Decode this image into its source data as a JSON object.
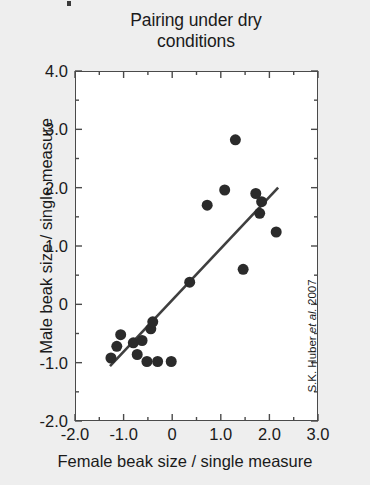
{
  "chart_data": {
    "type": "scatter",
    "title": "Pairing under dry conditions",
    "title_lines": [
      "Pairing under dry",
      "conditions"
    ],
    "xlabel": "Female beak size / single measure",
    "ylabel": "Male beak size / single measure",
    "attribution_prefix": "S.K. Huber ",
    "attribution_italic": "et al.",
    "attribution_suffix": " 2007",
    "xlim": [
      -2.0,
      3.0
    ],
    "ylim": [
      -2.0,
      4.0
    ],
    "xticks": [
      -2.0,
      -1.0,
      0,
      1.0,
      2.0,
      3.0
    ],
    "xtick_labels": [
      "-2.0",
      "-1.0",
      "0",
      "1.0",
      "2.0",
      "3.0"
    ],
    "yticks": [
      4.0,
      3.0,
      2.0,
      1.0,
      0,
      -1.0,
      -2.0
    ],
    "ytick_labels": [
      "4.0",
      "3.0",
      "2.0",
      "1.0",
      "0",
      "-1.0",
      "-2.0"
    ],
    "minor_ticks": true,
    "grid": false,
    "legend": null,
    "marker": "filled-circle",
    "marker_color": "#2b2b2b",
    "marker_size_px": 11,
    "line_color": "#3f3f3f",
    "points": [
      {
        "x": -1.06,
        "y": -0.52
      },
      {
        "x": -1.14,
        "y": -0.72
      },
      {
        "x": -1.26,
        "y": -0.92
      },
      {
        "x": -0.8,
        "y": -0.66
      },
      {
        "x": -0.72,
        "y": -0.86
      },
      {
        "x": -0.62,
        "y": -0.62
      },
      {
        "x": -0.52,
        "y": -0.98
      },
      {
        "x": -0.3,
        "y": -0.98
      },
      {
        "x": -0.02,
        "y": -0.98
      },
      {
        "x": -0.44,
        "y": -0.42
      },
      {
        "x": -0.4,
        "y": -0.3
      },
      {
        "x": 0.36,
        "y": 0.38
      },
      {
        "x": 0.72,
        "y": 1.7
      },
      {
        "x": 1.08,
        "y": 1.96
      },
      {
        "x": 1.3,
        "y": 2.82
      },
      {
        "x": 1.46,
        "y": 0.6
      },
      {
        "x": 1.72,
        "y": 1.9
      },
      {
        "x": 1.84,
        "y": 1.76
      },
      {
        "x": 1.8,
        "y": 1.56
      },
      {
        "x": 2.14,
        "y": 1.24
      }
    ],
    "trendline": {
      "x1": -1.28,
      "y1": -1.06,
      "x2": 2.18,
      "y2": 2.0
    }
  }
}
